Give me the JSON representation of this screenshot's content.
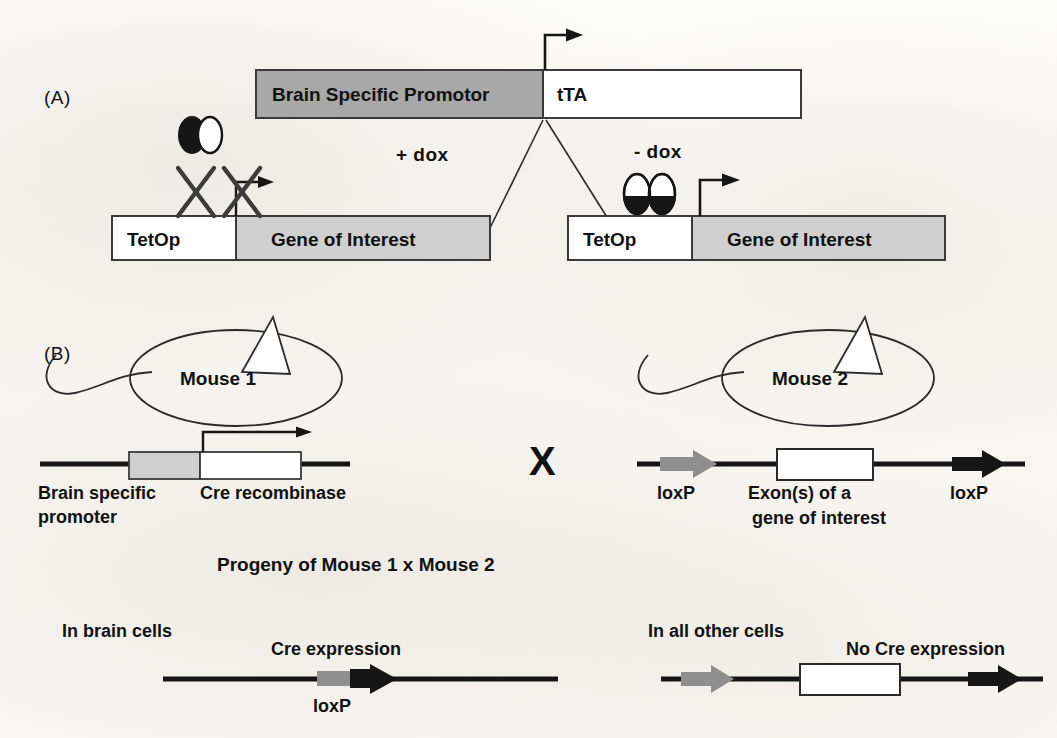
{
  "figure": {
    "colors": {
      "ink": "#161616",
      "promoter_gray": "#a8a8a8",
      "gene_gray": "#cfcfcf",
      "loxp_gray": "#8f8f8f",
      "paper": "#fbfaf8",
      "outline": "#3a3a3a"
    }
  },
  "panel_a": {
    "label": "(A)",
    "driver_construct": {
      "promoter_label": "Brain Specific Promotor",
      "gene_label": "tTA"
    },
    "branch_left": {
      "condition_label": "+ dox",
      "operator_label": "TetOp",
      "gene_label": "Gene of Interest",
      "tta_state": "inactive-dox-bound",
      "transcription": "blocked"
    },
    "branch_right": {
      "condition_label": "- dox",
      "operator_label": "TetOp",
      "gene_label": "Gene of Interest",
      "tta_state": "active-dimer-bound",
      "transcription": "active"
    }
  },
  "panel_b": {
    "label": "(B)",
    "mouse1": {
      "name": "Mouse 1",
      "promoter_label": "Brain specific",
      "promoter_label_line2": "promoter",
      "gene_label": "Cre recombinase",
      "transcription": "active"
    },
    "cross_symbol": "X",
    "mouse2": {
      "name": "Mouse 2",
      "loxp_left_label": "loxP",
      "exon_label": "Exon(s) of a",
      "exon_label_line2": "gene of interest",
      "loxp_right_label": "loxP"
    },
    "progeny_heading": "Progeny of Mouse 1 x Mouse 2",
    "outcome_left": {
      "cell_type_label": "In brain cells",
      "result_label": "Cre expression",
      "loxp_label": "loxP",
      "exon_state": "excised"
    },
    "outcome_right": {
      "cell_type_label": "In all other cells",
      "result_label": "No Cre expression",
      "exon_state": "intact"
    }
  }
}
